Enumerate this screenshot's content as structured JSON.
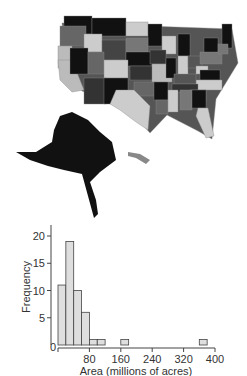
{
  "map": {
    "description": "Map of US states shaded in grayscale including Alaska and Hawaii"
  },
  "chart_data": {
    "type": "bar",
    "title": "",
    "xlabel": "Area (millions of acres)",
    "ylabel": "Frequency",
    "bin_width": 20,
    "bins": [
      {
        "start": 0,
        "end": 20,
        "count": 11
      },
      {
        "start": 20,
        "end": 40,
        "count": 19
      },
      {
        "start": 40,
        "end": 60,
        "count": 10
      },
      {
        "start": 60,
        "end": 80,
        "count": 6
      },
      {
        "start": 80,
        "end": 100,
        "count": 1
      },
      {
        "start": 100,
        "end": 120,
        "count": 1
      },
      {
        "start": 160,
        "end": 180,
        "count": 1
      },
      {
        "start": 360,
        "end": 380,
        "count": 1
      }
    ],
    "xticks": [
      "0",
      "80",
      "160",
      "240",
      "320",
      "400"
    ],
    "yticks": [
      "5",
      "10",
      "15",
      "20"
    ],
    "xlim": [
      0,
      400
    ],
    "ylim": [
      0,
      20
    ],
    "bar_color": "#dedede",
    "grid": false,
    "legend": null
  }
}
